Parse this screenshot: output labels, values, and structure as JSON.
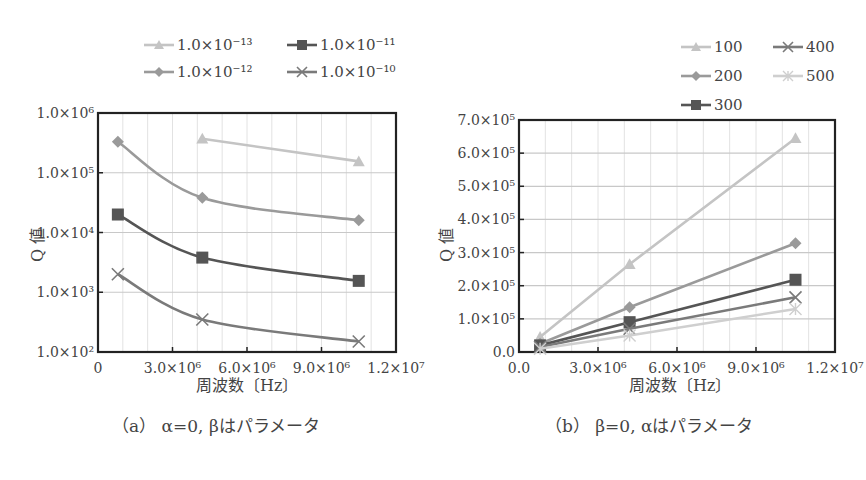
{
  "chart_data": [
    {
      "type": "line",
      "id": "a",
      "title": "",
      "caption": "（a） α=0, βはパラメータ",
      "xlabel": "周波数〔Hz〕",
      "ylabel": "Q 値",
      "yscale": "log",
      "xlim": [
        0,
        12000000
      ],
      "ylim": [
        100,
        1000000
      ],
      "x_ticks": [
        "0",
        "3.0×10⁶",
        "6.0×10⁶",
        "9.0×10⁶",
        "1.2×10⁷"
      ],
      "y_ticks": [
        "1.0×10²",
        "1.0×10³",
        "1.0×10⁴",
        "1.0×10⁵",
        "1.0×10⁶"
      ],
      "grid": true,
      "legend_position": "top-right",
      "series": [
        {
          "name": "1.0×10⁻¹³",
          "marker": "triangle",
          "color": "#c4c4c4",
          "x": [
            4200000,
            10500000
          ],
          "values": [
            370000,
            155000
          ]
        },
        {
          "name": "1.0×10⁻¹²",
          "marker": "diamond",
          "color": "#9a9a9a",
          "x": [
            800000,
            4200000,
            10500000
          ],
          "values": [
            330000,
            38000,
            16000
          ]
        },
        {
          "name": "1.0×10⁻¹¹",
          "marker": "square",
          "color": "#555555",
          "x": [
            800000,
            4200000,
            10500000
          ],
          "values": [
            20000,
            3800,
            1550
          ]
        },
        {
          "name": "1.0×10⁻¹⁰",
          "marker": "x",
          "color": "#7a7a7a",
          "x": [
            800000,
            4200000,
            10500000
          ],
          "values": [
            2000,
            350,
            150
          ]
        }
      ]
    },
    {
      "type": "line",
      "id": "b",
      "title": "",
      "caption": "（b） β=0, αはパラメータ",
      "xlabel": "周波数〔Hz〕",
      "ylabel": "Q 値",
      "yscale": "linear",
      "xlim": [
        0,
        12000000
      ],
      "ylim": [
        0,
        700000
      ],
      "x_ticks": [
        "0.0",
        "3.0×10⁶",
        "6.0×10⁶",
        "9.0×10⁶",
        "1.2×10⁷"
      ],
      "y_ticks": [
        "0.0",
        "1.0×10⁵",
        "2.0×10⁵",
        "3.0×10⁵",
        "4.0×10⁵",
        "5.0×10⁵",
        "6.0×10⁵",
        "7.0×10⁵"
      ],
      "grid": true,
      "legend_position": "top-right",
      "series": [
        {
          "name": "100",
          "marker": "triangle",
          "color": "#c4c4c4",
          "x": [
            800000,
            4200000,
            10500000
          ],
          "values": [
            45000,
            265000,
            645000
          ]
        },
        {
          "name": "200",
          "marker": "diamond",
          "color": "#9a9a9a",
          "x": [
            800000,
            4200000,
            10500000
          ],
          "values": [
            25000,
            135000,
            328000
          ]
        },
        {
          "name": "300",
          "marker": "square",
          "color": "#555555",
          "x": [
            800000,
            4200000,
            10500000
          ],
          "values": [
            20000,
            90000,
            218000
          ]
        },
        {
          "name": "400",
          "marker": "x",
          "color": "#7a7a7a",
          "x": [
            800000,
            4200000,
            10500000
          ],
          "values": [
            15000,
            70000,
            165000
          ]
        },
        {
          "name": "500",
          "marker": "asterisk",
          "color": "#cfcfcf",
          "x": [
            800000,
            4200000,
            10500000
          ],
          "values": [
            10000,
            50000,
            130000
          ]
        }
      ]
    }
  ]
}
